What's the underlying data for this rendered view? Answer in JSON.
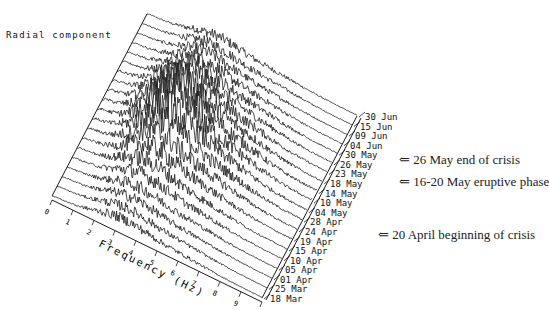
{
  "title": "Radial component",
  "chart_data": {
    "type": "waterfall",
    "title": "Radial component",
    "xlabel": "Frequency (Hz)",
    "ylabel": "",
    "x_ticks": [
      "0",
      "1",
      "2",
      "3",
      "4",
      "5",
      "6",
      "7",
      "8",
      "9",
      "10"
    ],
    "xlim": [
      0,
      10
    ],
    "dates": [
      "18 Mar",
      "25 Mar",
      "01 Apr",
      "05 Apr",
      "10 Apr",
      "15 Apr",
      "19 Apr",
      "24 Apr",
      "28 Apr",
      "04 May",
      "10 May",
      "14 May",
      "18 May",
      "23 May",
      "26 May",
      "30 May",
      "04 Jun",
      "09 Jun",
      "15 Jun",
      "30 Jun"
    ],
    "grid": false,
    "legend": null,
    "series_description": "Stacked amplitude spectra (one trace per date), 0-10 Hz; energy concentrated at 2-5 Hz, peaking in mid-May traces",
    "annotations": [
      {
        "date": "26 May",
        "text": "⇐ 26 May end of crisis"
      },
      {
        "date": "18 May",
        "text": "⇐ 16-20 May eruptive phase"
      },
      {
        "date": "19 Apr",
        "text": "⇐ 20 April beginning of crisis"
      }
    ]
  },
  "colors": {
    "line": "#1a1a1a",
    "background": "#ffffff",
    "text": "#222222"
  }
}
